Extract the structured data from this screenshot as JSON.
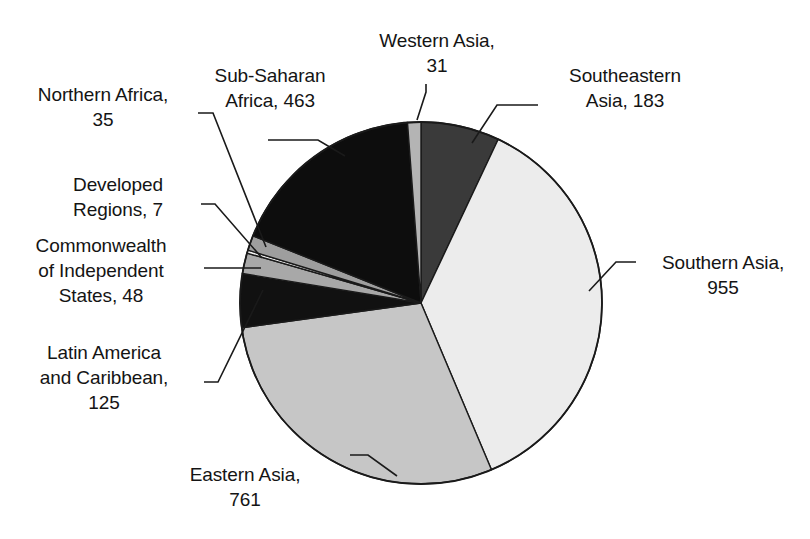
{
  "chart_data": {
    "type": "pie",
    "title": "",
    "subtitle": "",
    "xlabel": "",
    "ylabel": "",
    "legend_position": "none",
    "grid": false,
    "total": 2608,
    "units": "",
    "start_angle_deg": 0,
    "direction": "clockwise",
    "categories": [
      "Southeastern Asia",
      "Southern Asia",
      "Eastern Asia",
      "Latin America and Caribbean",
      "Commonwealth of Independent States",
      "Developed Regions",
      "Northern Africa",
      "Sub-Saharan Africa",
      "Western Asia"
    ],
    "values": [
      183,
      955,
      761,
      125,
      48,
      7,
      35,
      463,
      31
    ],
    "slices": [
      {
        "name": "Southeastern Asia",
        "value": 183,
        "label": "Southeastern\nAsia, 183",
        "color": "#3a3a3a",
        "percent": 7.0
      },
      {
        "name": "Southern Asia",
        "value": 955,
        "label": "Southern Asia,\n955",
        "color": "#ececec",
        "percent": 36.6
      },
      {
        "name": "Eastern Asia",
        "value": 761,
        "label": "Eastern Asia,\n761",
        "color": "#c6c6c6",
        "percent": 29.2
      },
      {
        "name": "Latin America and Caribbean",
        "value": 125,
        "label": "Latin America\nand Caribbean,\n125",
        "color": "#111111",
        "percent": 4.8
      },
      {
        "name": "Commonwealth of Independent States",
        "value": 48,
        "label": "Commonwealth\nof Independent\nStates, 48",
        "color": "#a8a8a8",
        "percent": 1.8
      },
      {
        "name": "Developed Regions",
        "value": 7,
        "label": "Developed\nRegions, 7",
        "color": "#f2f2f2",
        "percent": 0.3
      },
      {
        "name": "Northern Africa",
        "value": 35,
        "label": "Northern Africa,\n35",
        "color": "#9e9e9e",
        "percent": 1.3
      },
      {
        "name": "Sub-Saharan Africa",
        "value": 463,
        "label": "Sub-Saharan\nAfrica, 463",
        "color": "#0d0d0d",
        "percent": 17.8
      },
      {
        "name": "Western Asia",
        "value": 31,
        "label": "Western Asia,\n31",
        "color": "#b4b4b4",
        "percent": 1.2
      }
    ]
  },
  "labels": {
    "western_asia": "Western Asia,\n31",
    "sub_saharan_africa": "Sub-Saharan\nAfrica, 463",
    "southeastern_asia": "Southeastern\nAsia, 183",
    "northern_africa": "Northern Africa,\n35",
    "developed_regions": "Developed\nRegions, 7",
    "commonwealth": "Commonwealth\nof Independent\nStates, 48",
    "latin_america": "Latin America\nand Caribbean,\n125",
    "southern_asia": "Southern Asia,\n955",
    "eastern_asia": "Eastern Asia,\n761"
  },
  "geometry": {
    "center_x": 421,
    "center_y": 303,
    "radius": 181,
    "outline_color": "#1a1a1a"
  }
}
